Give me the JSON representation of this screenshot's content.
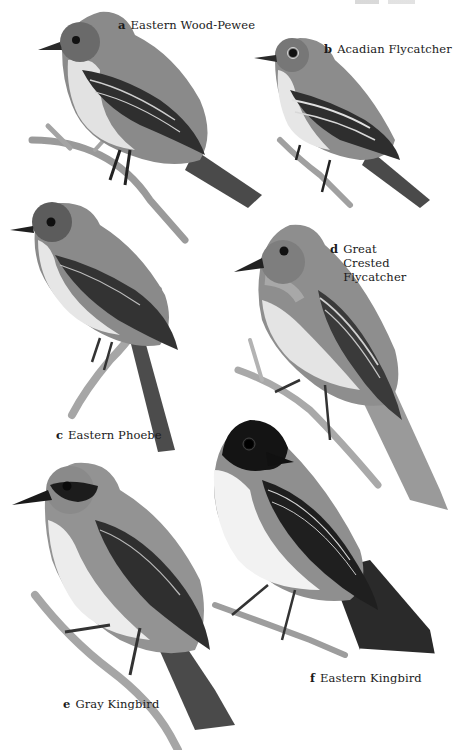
{
  "plate": {
    "header_text_visible": false,
    "species": [
      {
        "letter": "a",
        "name": "Eastern Wood-Pewee"
      },
      {
        "letter": "b",
        "name": "Acadian Flycatcher"
      },
      {
        "letter": "c",
        "name": "Eastern Phoebe"
      },
      {
        "letter": "d",
        "name": "Great Crested Flycatcher"
      },
      {
        "letter": "e",
        "name": "Gray Kingbird"
      },
      {
        "letter": "f",
        "name": "Eastern Kingbird"
      }
    ]
  },
  "colors": {
    "background": "#ffffff",
    "text": "#1a1a1a",
    "head_gray": "#7d7d7d",
    "wing_dark": "#3a3a3a",
    "belly_light": "#e6e6e6",
    "branch": "#9a9a9a",
    "kingbird_black": "#1e1e1e"
  }
}
